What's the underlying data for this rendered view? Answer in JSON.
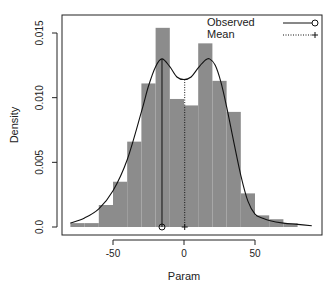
{
  "chart_data": {
    "type": "bar",
    "subtype": "histogram_with_density",
    "title": "",
    "xlabel": "Param",
    "ylabel": "Density",
    "xlim": [
      -82,
      96
    ],
    "ylim": [
      0,
      0.0165
    ],
    "x_ticks": [
      -50,
      0,
      50
    ],
    "x_tick_labels": [
      "-50",
      "0",
      "50"
    ],
    "y_ticks": [
      0.0,
      0.005,
      0.01,
      0.015
    ],
    "y_tick_labels": [
      "0.0",
      "0.005",
      "0.010",
      "0.015"
    ],
    "grid": false,
    "bin_edges": [
      -80,
      -70,
      -60,
      -50,
      -40,
      -30,
      -20,
      -10,
      0,
      10,
      20,
      30,
      40,
      50,
      60,
      70,
      80
    ],
    "categories": [
      "-80–-70",
      "-70–-60",
      "-60–-50",
      "-50–-40",
      "-40–-30",
      "-30–-20",
      "-20–-10",
      "-10–0",
      "0–10",
      "10–20",
      "20–30",
      "30–40",
      "40–50",
      "50–60",
      "60–70",
      "70–80"
    ],
    "values": [
      0.0003,
      0.0003,
      0.0017,
      0.0035,
      0.0066,
      0.0111,
      0.0154,
      0.0099,
      0.0094,
      0.0142,
      0.0113,
      0.0089,
      0.0026,
      0.0009,
      0.0006,
      0.0003
    ],
    "bar_color": "#8c8c8c",
    "density_curve": {
      "x": [
        -80,
        -70,
        -60,
        -50,
        -40,
        -30,
        -25,
        -20,
        -15.5,
        -10,
        -5,
        0,
        5,
        10,
        15,
        18,
        22,
        26,
        30,
        35,
        40,
        45,
        50,
        55,
        60,
        70,
        80,
        90
      ],
      "y": [
        0.0003,
        0.0007,
        0.0014,
        0.0028,
        0.0052,
        0.0089,
        0.0109,
        0.0124,
        0.013,
        0.0124,
        0.0116,
        0.0114,
        0.0116,
        0.0123,
        0.0129,
        0.013,
        0.0125,
        0.0112,
        0.0093,
        0.0066,
        0.004,
        0.002,
        0.001,
        0.0007,
        0.0005,
        0.0003,
        0.0002,
        0.0001
      ]
    },
    "observed": {
      "x": -15.5,
      "y_top": 0.013,
      "marker": "circle"
    },
    "mean": {
      "x": 0.5,
      "y_top": 0.0114,
      "marker": "plus"
    },
    "legend": {
      "position": "top-right",
      "entries": [
        {
          "label": "Observed",
          "line": "solid",
          "marker": "circle"
        },
        {
          "label": "Mean",
          "line": "dotted",
          "marker": "plus"
        }
      ]
    }
  }
}
